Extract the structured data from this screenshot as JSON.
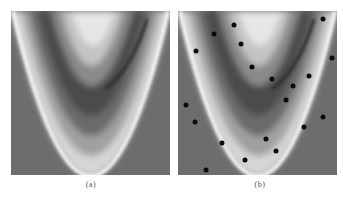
{
  "figure": {
    "panels": [
      {
        "id": "a",
        "caption": "(a)",
        "description": "Contour heatmap of banana-shaped (Rosenbrock-like) function"
      },
      {
        "id": "b",
        "caption": "(b)",
        "description": "Same contour heatmap with sample points overlaid"
      }
    ],
    "colors": {
      "background": "#6d6d6d",
      "dark_band": "#4a4a4a",
      "light_band": "#e8e8e8",
      "bright_ridge": "#fafafa",
      "sample_point": "#0c0c0c"
    }
  },
  "chart_data": [
    {
      "type": "heatmap",
      "title": "",
      "caption": "(a)",
      "xlabel": "",
      "ylabel": "",
      "grid": false,
      "legend": null,
      "shape": "parabolic (banana) valley opening upward, bright outer ridge, dark inner band, light core at top"
    },
    {
      "type": "scatter",
      "title": "",
      "caption": "(b)",
      "xlabel": "",
      "ylabel": "",
      "grid": false,
      "legend": null,
      "background": "same heatmap as (a)",
      "points_px_in_panel": [
        {
          "x": 56,
          "y": 14
        },
        {
          "x": 36,
          "y": 23
        },
        {
          "x": 63,
          "y": 33
        },
        {
          "x": 18,
          "y": 40
        },
        {
          "x": 74,
          "y": 56
        },
        {
          "x": 145,
          "y": 8
        },
        {
          "x": 154,
          "y": 47
        },
        {
          "x": 131,
          "y": 65
        },
        {
          "x": 94,
          "y": 68
        },
        {
          "x": 115,
          "y": 75
        },
        {
          "x": 8,
          "y": 94
        },
        {
          "x": 17,
          "y": 111
        },
        {
          "x": 44,
          "y": 132
        },
        {
          "x": 67,
          "y": 149
        },
        {
          "x": 28,
          "y": 159
        },
        {
          "x": 108,
          "y": 89
        },
        {
          "x": 145,
          "y": 106
        },
        {
          "x": 126,
          "y": 116
        },
        {
          "x": 88,
          "y": 128
        },
        {
          "x": 98,
          "y": 140
        }
      ]
    }
  ]
}
